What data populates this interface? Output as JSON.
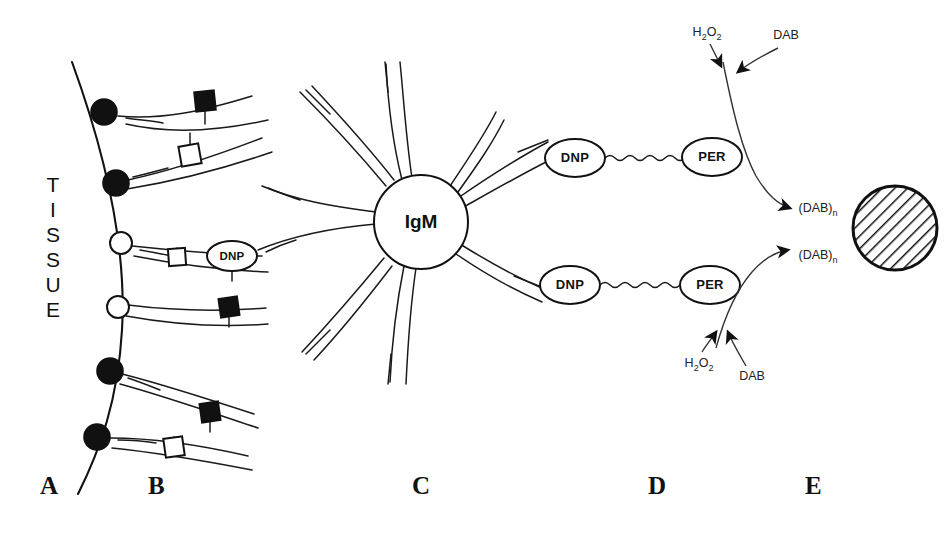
{
  "figure": {
    "type": "schematic-diagram",
    "background_color": "#ffffff",
    "ink_color": "#111111"
  },
  "tissue": {
    "label_text": "TISSUE",
    "letters": [
      "T",
      "I",
      "S",
      "S",
      "U",
      "E"
    ]
  },
  "panels": [
    {
      "id": "A",
      "label": "A",
      "x": 40,
      "y": 486,
      "description": "tissue section boundary"
    },
    {
      "id": "B",
      "label": "B",
      "x": 148,
      "y": 486,
      "description": "hapten-conjugated primary antibodies bound to tissue antigens"
    },
    {
      "id": "C",
      "label": "C",
      "x": 412,
      "y": 486,
      "description": "IgM anti-hapten bridging antibody"
    },
    {
      "id": "D",
      "label": "D",
      "x": 648,
      "y": 486,
      "description": "DNP-peroxidase conjugate"
    },
    {
      "id": "E",
      "label": "E",
      "x": 805,
      "y": 486,
      "description": "DAB reaction product deposit"
    }
  ],
  "antigens": [
    {
      "index": 1,
      "kind": "filled-circle",
      "cx": 104,
      "cy": 112,
      "r": 13
    },
    {
      "index": 2,
      "kind": "filled-circle",
      "cx": 116,
      "cy": 183,
      "r": 13
    },
    {
      "index": 3,
      "kind": "open-circle",
      "cx": 121,
      "cy": 243,
      "r": 11
    },
    {
      "index": 4,
      "kind": "open-circle",
      "cx": 118,
      "cy": 307,
      "r": 11
    },
    {
      "index": 5,
      "kind": "filled-circle",
      "cx": 110,
      "cy": 371,
      "r": 13
    },
    {
      "index": 6,
      "kind": "filled-circle",
      "cx": 97,
      "cy": 437,
      "r": 13
    }
  ],
  "haptens": [
    {
      "index": 1,
      "kind": "filled-square",
      "cx": 205,
      "cy": 101,
      "size": 20,
      "rotation": -6
    },
    {
      "index": 2,
      "kind": "open-square",
      "cx": 190,
      "cy": 155,
      "size": 20,
      "rotation": -10
    },
    {
      "index": 3,
      "kind": "open-square",
      "cx": 177,
      "cy": 257,
      "size": 17,
      "rotation": -4
    },
    {
      "index": 4,
      "kind": "filled-square",
      "cx": 229,
      "cy": 307,
      "size": 19,
      "rotation": -8
    },
    {
      "index": 5,
      "kind": "filled-square",
      "cx": 210,
      "cy": 412,
      "size": 19,
      "rotation": -8
    },
    {
      "index": 6,
      "kind": "open-square",
      "cx": 174,
      "cy": 447,
      "size": 19,
      "rotation": -8
    }
  ],
  "ovals": [
    {
      "id": "dnp-b",
      "label": "DNP",
      "cx": 232,
      "cy": 256,
      "rx": 25,
      "ry": 15
    },
    {
      "id": "dnp-d1",
      "label": "DNP",
      "cx": 575,
      "cy": 158,
      "rx": 30,
      "ry": 19
    },
    {
      "id": "per-d1",
      "label": "PER",
      "cx": 712,
      "cy": 157,
      "rx": 30,
      "ry": 19
    },
    {
      "id": "dnp-d2",
      "label": "DNP",
      "cx": 570,
      "cy": 285,
      "rx": 30,
      "ry": 19
    },
    {
      "id": "per-d2",
      "label": "PER",
      "cx": 710,
      "cy": 285,
      "rx": 30,
      "ry": 19
    }
  ],
  "igm": {
    "label": "IgM",
    "cx": 421,
    "cy": 222,
    "r": 47,
    "arm_count": 8
  },
  "reagents": [
    {
      "id": "h2o2-top",
      "text": "H2O2",
      "html": "H<sub>2</sub>O<sub>2</sub>",
      "x": 707,
      "y": 33
    },
    {
      "id": "dab-top",
      "text": "DAB",
      "html": "DAB",
      "x": 786,
      "y": 36
    },
    {
      "id": "h2o2-bot",
      "text": "H2O2",
      "html": "H<sub>2</sub>O<sub>2</sub>",
      "x": 699,
      "y": 364
    },
    {
      "id": "dab-bot",
      "text": "DAB",
      "html": "DAB",
      "x": 752,
      "y": 377
    }
  ],
  "products": [
    {
      "id": "dab-n-top",
      "text": "(DAB)n",
      "x": 818,
      "y": 209
    },
    {
      "id": "dab-n-bot",
      "text": "(DAB)n",
      "x": 818,
      "y": 256
    }
  ],
  "deposit": {
    "id": "dab-deposit",
    "shape": "hatched-circle",
    "cx": 895,
    "cy": 228,
    "r": 42,
    "hatch_angle_deg": 45
  }
}
